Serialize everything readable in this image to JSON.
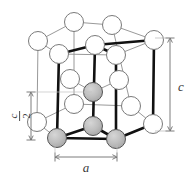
{
  "figure": {
    "type": "crystal-structure-diagram",
    "background_color": "#ffffff"
  },
  "labels": {
    "lattice_param_a": "a",
    "lattice_param_c": "c",
    "half_c_numerator": "c",
    "half_c_denominator": "2",
    "half_c_fraction_bar": ""
  },
  "colors": {
    "atom_open_fill": "#ffffff",
    "atom_open_stroke": "#7a7a7a",
    "atom_shaded_fill": "#b9b9b9",
    "atom_shaded_stroke": "#555555",
    "bond_thick": "#111111",
    "edge_light": "#8d8d8d",
    "dimension_line": "#6d6d6d",
    "label_text": "#3a3a3a"
  },
  "geometry": {
    "atom_radius_open": 9.5,
    "atom_radius_shaded": 9.5,
    "thick_bond_width": 2.6,
    "light_edge_width": 0.9
  },
  "atoms": {
    "top_layer": [
      {
        "id": "t-back",
        "cx": 74,
        "cy": 22,
        "type": "open"
      },
      {
        "id": "t-bleft",
        "cx": 112,
        "cy": 25,
        "type": "open"
      },
      {
        "id": "t-left",
        "cx": 38,
        "cy": 41,
        "type": "open"
      },
      {
        "id": "t-center",
        "cx": 95,
        "cy": 45,
        "type": "open"
      },
      {
        "id": "t-right",
        "cx": 154,
        "cy": 40,
        "type": "open"
      },
      {
        "id": "t-fleft",
        "cx": 59,
        "cy": 54,
        "type": "open"
      },
      {
        "id": "t-fright",
        "cx": 116,
        "cy": 55,
        "type": "open"
      }
    ],
    "middle_layer": [
      {
        "id": "m-left",
        "cx": 70,
        "cy": 79,
        "type": "open"
      },
      {
        "id": "m-right",
        "cx": 119,
        "cy": 80,
        "type": "open"
      },
      {
        "id": "m-center",
        "cx": 93,
        "cy": 92,
        "type": "shaded"
      }
    ],
    "bottom_layer": [
      {
        "id": "b-back",
        "cx": 74,
        "cy": 104,
        "type": "open"
      },
      {
        "id": "b-bright",
        "cx": 131,
        "cy": 106,
        "type": "open"
      },
      {
        "id": "b-left",
        "cx": 37,
        "cy": 122,
        "type": "open"
      },
      {
        "id": "b-center",
        "cx": 93,
        "cy": 126,
        "type": "shaded"
      },
      {
        "id": "b-right",
        "cx": 153,
        "cy": 124,
        "type": "open"
      },
      {
        "id": "b-fleft",
        "cx": 57,
        "cy": 138,
        "type": "shaded"
      },
      {
        "id": "b-fright",
        "cx": 116,
        "cy": 139,
        "type": "shaded"
      }
    ]
  },
  "dimensions": {
    "c": {
      "x": 170,
      "y_top": 38,
      "y_bottom": 131,
      "label_x": 181,
      "label_y": 88
    },
    "c_over_2": {
      "x": 31,
      "y_top": 92,
      "y_bottom": 140,
      "label_x": 20,
      "label_y": 116
    },
    "a": {
      "y": 157,
      "x_left": 55,
      "x_right": 117,
      "label_x": 86,
      "label_y": 171
    }
  }
}
